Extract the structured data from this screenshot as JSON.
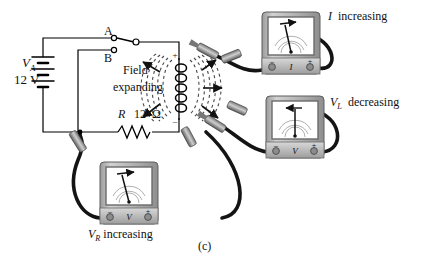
{
  "figure": {
    "caption": "(c)",
    "background": "#ffffff",
    "wire_color": "#000000",
    "lead_color": "#1a1a1a",
    "meter_body": "#b9b9b9",
    "meter_face": "#ffffff",
    "field_color": "#555555"
  },
  "source": {
    "symbol_label": "V",
    "symbol_sub": "A",
    "value": "12  V"
  },
  "switch": {
    "contact_a": "A",
    "contact_b": "B",
    "position": "A"
  },
  "resistor": {
    "designator": "R",
    "value": "12",
    "unit": "Ω"
  },
  "coil": {
    "field_label_line1": "Field",
    "field_label_line2": "expanding",
    "polarity_top": "+",
    "polarity_bottom": "–"
  },
  "meters": [
    {
      "id": "ammeter",
      "quantity": "I",
      "terminal_minus": "–",
      "terminal_plus": "+",
      "annotation_symbol": "I",
      "annotation_text": "increasing",
      "needle_angle": -12,
      "trend": "up"
    },
    {
      "id": "voltmeter-inductor",
      "quantity": "V",
      "terminal_minus": "–",
      "terminal_plus": "+",
      "annotation_symbol": "V",
      "annotation_sub": "L",
      "annotation_text": "decreasing",
      "needle_angle": 0,
      "trend": "down"
    },
    {
      "id": "voltmeter-resistor",
      "quantity": "V",
      "terminal_minus": "–",
      "terminal_plus": "+",
      "annotation_symbol": "V",
      "annotation_sub": "R",
      "annotation_text": "increasing",
      "needle_angle": -14,
      "trend": "up"
    }
  ]
}
